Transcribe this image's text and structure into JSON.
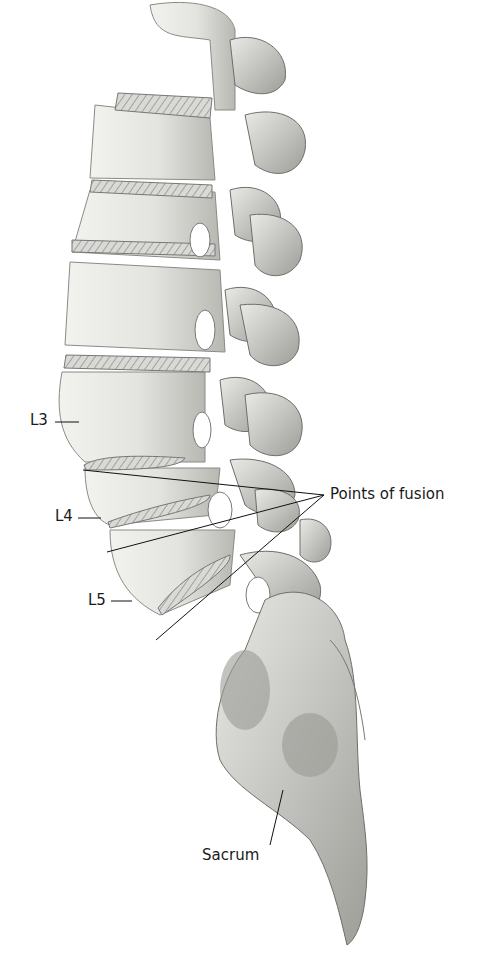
{
  "figure": {
    "labels": {
      "l3": "L3",
      "l4": "L4",
      "l5": "L5",
      "points_of_fusion": "Points of fusion",
      "sacrum": "Sacrum"
    },
    "colors": {
      "bone": "#e6e6e3",
      "bone_shade": "#b9b9b5",
      "bone_dark": "#8a8a86",
      "outline": "#6e6e6a",
      "leader": "#111111",
      "background": "#ffffff"
    }
  }
}
